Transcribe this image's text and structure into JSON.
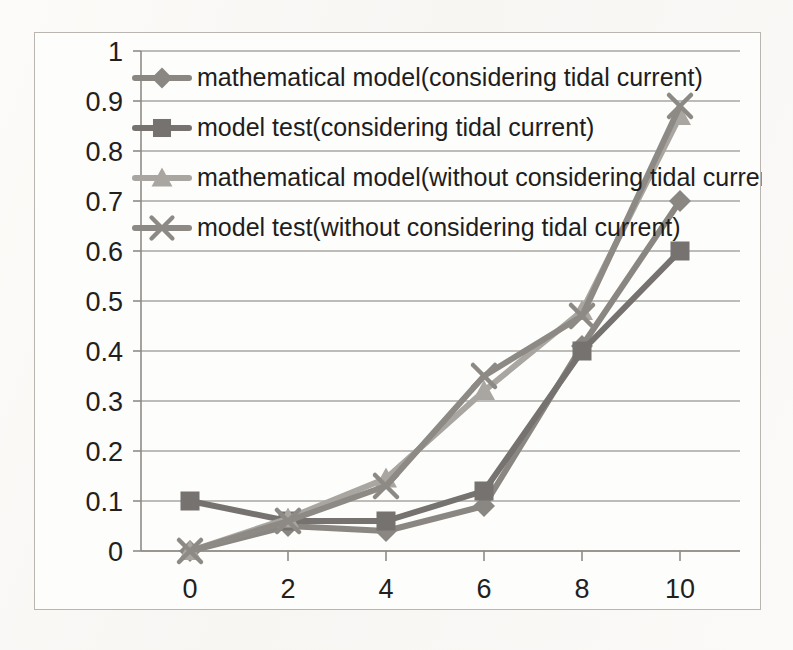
{
  "chart_data": {
    "type": "line",
    "title": "",
    "subtitle": "",
    "xlabel": "",
    "ylabel": "",
    "x": [
      0,
      2,
      4,
      6,
      8,
      10
    ],
    "xticks": [
      "0",
      "2",
      "4",
      "6",
      "8",
      "10"
    ],
    "yticks": [
      "0",
      "0.1",
      "0.2",
      "0.3",
      "0.4",
      "0.5",
      "0.6",
      "0.7",
      "0.8",
      "0.9",
      "1"
    ],
    "xlim": [
      -1,
      11
    ],
    "ylim": [
      0,
      1
    ],
    "grid": "horizontal",
    "legend_position": "inside-top-left",
    "series": [
      {
        "name": "mathematical model(considering tidal current)",
        "marker": "diamond",
        "color": "#8a8782",
        "values": [
          0.0,
          0.05,
          0.04,
          0.09,
          0.41,
          0.7
        ]
      },
      {
        "name": "model test(considering tidal current)",
        "marker": "square",
        "color": "#757270",
        "values": [
          0.1,
          0.06,
          0.06,
          0.12,
          0.4,
          0.6
        ]
      },
      {
        "name": "mathematical model(without considering tidal current)",
        "marker": "triangle",
        "color": "#a9a6a1",
        "values": [
          0.0,
          0.065,
          0.145,
          0.32,
          0.48,
          0.87
        ]
      },
      {
        "name": "model test(without considering tidal current)",
        "marker": "cross",
        "color": "#8d8a85",
        "values": [
          0.0,
          0.06,
          0.13,
          0.35,
          0.47,
          0.89
        ]
      }
    ]
  },
  "legend": {
    "entries": [
      {
        "label": "mathematical model(considering tidal current)",
        "marker": "diamond-marker-icon"
      },
      {
        "label": "model test(considering tidal current)",
        "marker": "square-marker-icon"
      },
      {
        "label": "mathematical model(without considering tidal current)",
        "marker": "triangle-marker-icon"
      },
      {
        "label": "model test(without considering tidal current)",
        "marker": "cross-marker-icon"
      }
    ]
  },
  "colors": {
    "plot_frame": "#b9b6b1",
    "gridline": "#a9a6a2",
    "axis": "#8e8b87",
    "text": "#231f1e",
    "background": "#fdfdfc"
  }
}
